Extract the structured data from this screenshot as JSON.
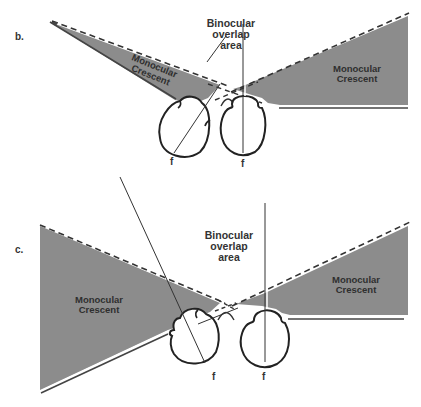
{
  "figure": {
    "colors": {
      "background": "#ffffff",
      "crescent_fill": "#8c8c8c",
      "line": "#222222"
    },
    "panels": [
      {
        "id": "b",
        "label": "b.",
        "overlap_label": [
          "Binocular",
          "overlap",
          "area"
        ],
        "left_crescent_label": [
          "Monocular",
          "Crescent"
        ],
        "right_crescent_label": [
          "Monocular",
          "Crescent"
        ],
        "fovea_labels": [
          "f",
          "f"
        ]
      },
      {
        "id": "c",
        "label": "c.",
        "overlap_label": [
          "Binocular",
          "overlap",
          "area"
        ],
        "left_crescent_label": [
          "Monocular",
          "Crescent"
        ],
        "right_crescent_label": [
          "Monocular",
          "Crescent"
        ],
        "fovea_labels": [
          "f",
          "f"
        ]
      }
    ]
  }
}
